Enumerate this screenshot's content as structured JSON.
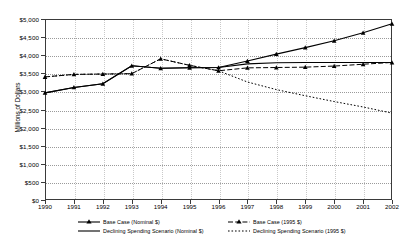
{
  "chart_data": {
    "type": "line",
    "title": "",
    "xlabel": "",
    "ylabel": "Millions of Dollars",
    "x": [
      1990,
      1991,
      1992,
      1993,
      1994,
      1995,
      1996,
      1997,
      1998,
      1999,
      2000,
      2001,
      2002
    ],
    "xlim": [
      1990,
      2002
    ],
    "ylim": [
      0,
      5000
    ],
    "yticks": [
      0,
      500,
      1000,
      1500,
      2000,
      2500,
      3000,
      3500,
      4000,
      4500,
      5000
    ],
    "ytick_labels": [
      "$0",
      "$500",
      "$1,000",
      "$1,500",
      "$2,000",
      "$2,500",
      "$3,000",
      "$3,500",
      "$4,000",
      "$4,500",
      "$5,000"
    ],
    "xtick_labels": [
      "1990",
      "1991",
      "1992",
      "1993",
      "1994",
      "1995",
      "1996",
      "1997",
      "1998",
      "1999",
      "2000",
      "2001",
      "2002"
    ],
    "grid": true,
    "legend_position": "bottom",
    "series": [
      {
        "name": "Base Case (Nominal $)",
        "style": "solid",
        "marker": "triangle",
        "color": "#000000",
        "values": [
          2960,
          3110,
          3210,
          3710,
          3640,
          3655,
          3660,
          3840,
          4030,
          4210,
          4400,
          4620,
          4870
        ]
      },
      {
        "name": "Declining Spending Scenario (Nominal $)",
        "style": "solid",
        "marker": "none",
        "color": "#000000",
        "values": [
          2960,
          3110,
          3210,
          3710,
          3640,
          3655,
          3660,
          3760,
          3790,
          3800,
          3800,
          3800,
          3800
        ]
      },
      {
        "name": "Base Case (1995 $)",
        "style": "dashed",
        "marker": "triangle",
        "color": "#000000",
        "values": [
          3400,
          3470,
          3480,
          3490,
          3900,
          3720,
          3570,
          3650,
          3660,
          3670,
          3700,
          3750,
          3800
        ]
      },
      {
        "name": "Declining Spending Scenario (1995 $)",
        "style": "dotted",
        "marker": "none",
        "color": "#000000",
        "values": [
          3400,
          3470,
          3480,
          3490,
          3900,
          3720,
          3570,
          3260,
          3050,
          2880,
          2720,
          2570,
          2400
        ]
      }
    ]
  },
  "legend": {
    "left_column": [
      {
        "label": "Base Case (Nominal $)",
        "style": "solid",
        "marker": "triangle"
      },
      {
        "label": "Declining Spending Scenario (Nominal $)",
        "style": "solid",
        "marker": "none"
      }
    ],
    "right_column": [
      {
        "label": "Base Case (1995 $)",
        "style": "dashed",
        "marker": "triangle"
      },
      {
        "label": "Declining Spending Scenario (1995 $)",
        "style": "dotted",
        "marker": "none"
      }
    ]
  }
}
